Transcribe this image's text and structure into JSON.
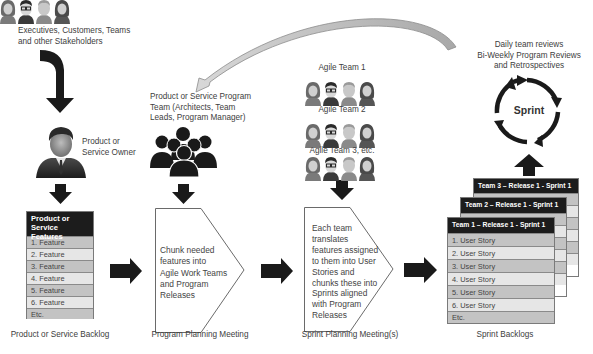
{
  "stakeholders": {
    "label_line1": "Executives, Customers, Teams",
    "label_line2": "and other Stakeholders",
    "input_arrow_text": "INPUT"
  },
  "owner": {
    "label_line1": "Product or",
    "label_line2": "Service Owner",
    "icon": "businessman-icon"
  },
  "product_backlog": {
    "header_line1": "Product or Service",
    "header_line2": "Features",
    "rows": [
      "1. Feature",
      "2. Feature",
      "3. Feature",
      "4. Feature",
      "5. Feature",
      "6. Feature",
      "Etc."
    ],
    "caption": "Product or Service Backlog"
  },
  "program_team": {
    "label_line1": "Product or Service Program",
    "label_line2": "Team (Architects, Team",
    "label_line3": "Leads, Program Manager)",
    "icon": "group-icon"
  },
  "program_planning": {
    "text_lines": [
      "Chunk needed",
      "features into",
      "Agile Work Teams",
      "and Program",
      "Releases"
    ],
    "caption": "Program Planning Meeting"
  },
  "agile_teams": [
    {
      "label": "Agile Team 1"
    },
    {
      "label": "Agile Team 2"
    },
    {
      "label": "Agile Team 3, etc."
    }
  ],
  "sprint_planning": {
    "text_lines": [
      "Each team",
      "translates",
      "features assigned",
      "to them into User",
      "Stories and",
      "chunks these into",
      "Sprints aligned",
      "with Program",
      "Releases"
    ],
    "caption": "Sprint Planning Meeting(s)"
  },
  "reviews": {
    "line1": "Daily team reviews",
    "line2": "Bi-Weekly Program Reviews",
    "line3": "and Retrospectives"
  },
  "sprint_cycle": {
    "label": "Sprint"
  },
  "sprint_backlogs": {
    "team3": {
      "header": "Team 3 – Release 1 - Sprint 1"
    },
    "team2": {
      "header": "Team 2 – Release 1 - Sprint 1"
    },
    "team1": {
      "header": "Team 1 – Release 1 - Sprint 1",
      "rows": [
        "1. User Story",
        "2. User Story",
        "3. User Story",
        "4. User Story",
        "5. User Story",
        "6. User Story",
        "Etc."
      ]
    },
    "caption": "Sprint Backlogs"
  },
  "colors": {
    "header_bg": "#1c1c1c",
    "row_dark": "#c3c3c3",
    "row_light": "#e6e6e6",
    "arrow": "#1a1a1a",
    "feedback_arrow": "#bdbdbd"
  }
}
